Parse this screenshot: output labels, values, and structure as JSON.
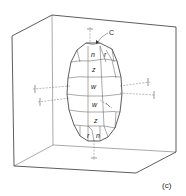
{
  "figure": {
    "caption": "(c)",
    "pointer_label": "C",
    "facet_labels": {
      "top_n": "n",
      "top_r": "r",
      "z_upper": "z",
      "w_upper": "w",
      "w_lower": "w",
      "z_lower": "z",
      "bottom_r": "r",
      "bottom_n": "n"
    }
  }
}
